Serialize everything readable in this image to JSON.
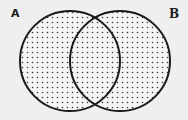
{
  "diagram": {
    "type": "venn",
    "sets": [
      {
        "label": "A",
        "cx": 70,
        "cy": 61,
        "r": 50
      },
      {
        "label": "B",
        "cx": 120,
        "cy": 61,
        "r": 50
      }
    ],
    "shaded_region": "A ∪ B",
    "fill_pattern": "dotted",
    "colors": {
      "background": "#efefef",
      "stroke": "#1a1a1a",
      "dot": "#3a3a3a"
    }
  }
}
